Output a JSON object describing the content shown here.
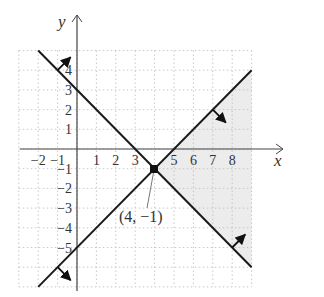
{
  "chart_data": {
    "type": "line",
    "title": "",
    "xlabel": "x",
    "ylabel": "y",
    "xlim": [
      -3,
      9
    ],
    "ylim": [
      -7,
      5
    ],
    "grid": true,
    "x_ticks": [
      "-2",
      "-1",
      "1",
      "2",
      "3",
      "5",
      "6",
      "7",
      "8"
    ],
    "y_ticks": [
      "4",
      "3",
      "2",
      "1",
      "-1",
      "-2",
      "-3",
      "-4",
      "-5"
    ],
    "series": [
      {
        "name": "y = -x + 3",
        "points": [
          [
            -2,
            5
          ],
          [
            9,
            -6
          ]
        ],
        "arrows": "toward upper-right (y ≥ -x + 3)"
      },
      {
        "name": "y = x - 5",
        "points": [
          [
            -2,
            -7
          ],
          [
            9,
            4
          ]
        ],
        "arrows": "toward lower-right (y ≤ x - 5)"
      }
    ],
    "shaded_region": {
      "description": "feasible region right of intersection, between the two lines",
      "vertex": [
        4,
        -1
      ],
      "x_range": [
        4,
        9
      ]
    },
    "annotations": [
      {
        "text": "(4, −1)",
        "point": [
          4,
          -1
        ]
      }
    ]
  },
  "labels": {
    "x_axis": "x",
    "y_axis": "y",
    "point_label": "(4, −1)",
    "xticks": [
      {
        "v": -2,
        "t": "−2"
      },
      {
        "v": -1,
        "t": "−1"
      },
      {
        "v": 1,
        "t": "1"
      },
      {
        "v": 2,
        "t": "2"
      },
      {
        "v": 3,
        "t": "3"
      },
      {
        "v": 5,
        "t": "5"
      },
      {
        "v": 6,
        "t": "6"
      },
      {
        "v": 7,
        "t": "7"
      },
      {
        "v": 8,
        "t": "8"
      }
    ],
    "yticks": [
      {
        "v": 4,
        "t": "4"
      },
      {
        "v": 3,
        "t": "3"
      },
      {
        "v": 2,
        "t": "2"
      },
      {
        "v": 1,
        "t": "1"
      },
      {
        "v": -1,
        "t": "−1"
      },
      {
        "v": -2,
        "t": "−2"
      },
      {
        "v": -3,
        "t": "−3"
      },
      {
        "v": -4,
        "t": "−4"
      },
      {
        "v": -5,
        "t": "−5"
      }
    ]
  }
}
